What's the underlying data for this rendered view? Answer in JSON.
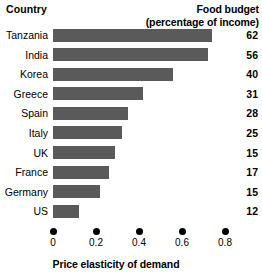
{
  "header": {
    "country_label": "Country",
    "value_label_line1": "Food budget",
    "value_label_line2": "(percentage of income)"
  },
  "axis": {
    "title": "Price elasticity of demand",
    "ticks": [
      "0",
      "0.2",
      "0.4",
      "0.6",
      "0.8"
    ]
  },
  "colors": {
    "bar": "#5a5a5a",
    "text": "#000000",
    "background": "#ffffff"
  },
  "chart_data": {
    "type": "bar",
    "orientation": "horizontal",
    "title": "",
    "xlabel": "Price elasticity of demand",
    "ylabel": "Country",
    "xlim": [
      0,
      0.9
    ],
    "xticks": [
      0,
      0.2,
      0.4,
      0.6,
      0.8
    ],
    "grid": false,
    "legend": false,
    "categories": [
      "Tanzania",
      "India",
      "Korea",
      "Greece",
      "Spain",
      "Italy",
      "UK",
      "France",
      "Germany",
      "US"
    ],
    "series": [
      {
        "name": "Price elasticity of demand",
        "values": [
          0.74,
          0.72,
          0.56,
          0.42,
          0.35,
          0.32,
          0.29,
          0.26,
          0.22,
          0.12
        ]
      }
    ],
    "annotations": {
      "name": "Food budget (percentage of income)",
      "values": [
        62,
        56,
        40,
        31,
        28,
        25,
        15,
        17,
        15,
        12
      ]
    },
    "rows": [
      {
        "country": "Tanzania",
        "elasticity": 0.74,
        "food_budget": 62
      },
      {
        "country": "India",
        "elasticity": 0.72,
        "food_budget": 56
      },
      {
        "country": "Korea",
        "elasticity": 0.56,
        "food_budget": 40
      },
      {
        "country": "Greece",
        "elasticity": 0.42,
        "food_budget": 31
      },
      {
        "country": "Spain",
        "elasticity": 0.35,
        "food_budget": 28
      },
      {
        "country": "Italy",
        "elasticity": 0.32,
        "food_budget": 25
      },
      {
        "country": "UK",
        "elasticity": 0.29,
        "food_budget": 15
      },
      {
        "country": "France",
        "elasticity": 0.26,
        "food_budget": 17
      },
      {
        "country": "Germany",
        "elasticity": 0.22,
        "food_budget": 15
      },
      {
        "country": "US",
        "elasticity": 0.12,
        "food_budget": 12
      }
    ]
  }
}
